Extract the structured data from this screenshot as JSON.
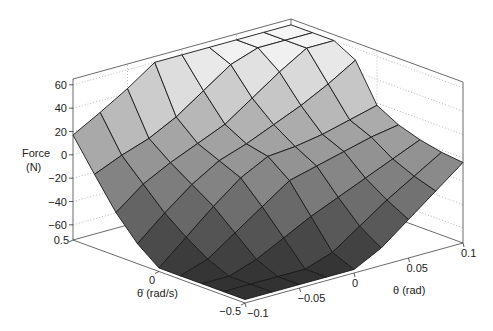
{
  "chart_data": {
    "type": "surface3d",
    "title": "",
    "xlabel": "θ (rad)",
    "ylabel": "θ̇ (rad/s)",
    "zlabel_line1": "Force",
    "zlabel_line2": "(N)",
    "x_range": [
      -0.1,
      0.1
    ],
    "y_range": [
      -0.5,
      0.5
    ],
    "z_range": [
      -73,
      65
    ],
    "x": [
      -0.1,
      -0.075,
      -0.05,
      -0.025,
      0,
      0.025,
      0.05,
      0.075,
      0.1
    ],
    "y": [
      -0.5,
      -0.375,
      -0.25,
      -0.125,
      0,
      0.125,
      0.25,
      0.375,
      0.5
    ],
    "z": [
      [
        -70,
        -70,
        -70,
        -70,
        -70,
        -58,
        -40,
        -22,
        -4
      ],
      [
        -70,
        -70,
        -70,
        -70,
        -62,
        -46,
        -30,
        -16,
        -2
      ],
      [
        -70,
        -70,
        -62,
        -50,
        -38,
        -28,
        -18,
        -8,
        2
      ],
      [
        -70,
        -62,
        -46,
        -30,
        -14,
        -8,
        -2,
        4,
        8
      ],
      [
        -70,
        -50,
        -30,
        -12,
        0,
        2,
        6,
        12,
        18
      ],
      [
        -56,
        -36,
        -18,
        -4,
        4,
        14,
        24,
        36,
        50
      ],
      [
        -36,
        -18,
        -6,
        4,
        14,
        30,
        46,
        60,
        60
      ],
      [
        -10,
        0,
        8,
        20,
        36,
        52,
        60,
        60,
        60
      ],
      [
        17,
        30,
        44,
        60,
        60,
        60,
        60,
        60,
        60
      ]
    ],
    "z_ticks": [
      60,
      40,
      20,
      0,
      -20,
      -40,
      -60
    ],
    "x_ticks": [
      -0.1,
      -0.05,
      0,
      0.05,
      0.1
    ],
    "x_tick_labels": [
      "−0.1",
      "−0.05",
      "0",
      "0.05",
      "0.1"
    ],
    "y_ticks": [
      -0.5,
      0,
      0.5
    ],
    "y_tick_labels": [
      "−0.5",
      "0",
      "0.5"
    ],
    "z_tick_labels": [
      "60",
      "40",
      "20",
      "0",
      "−20",
      "−40",
      "−60"
    ],
    "grid": "dotted on back walls",
    "colormap": "grayscale (dark = low force, light = high force)"
  }
}
